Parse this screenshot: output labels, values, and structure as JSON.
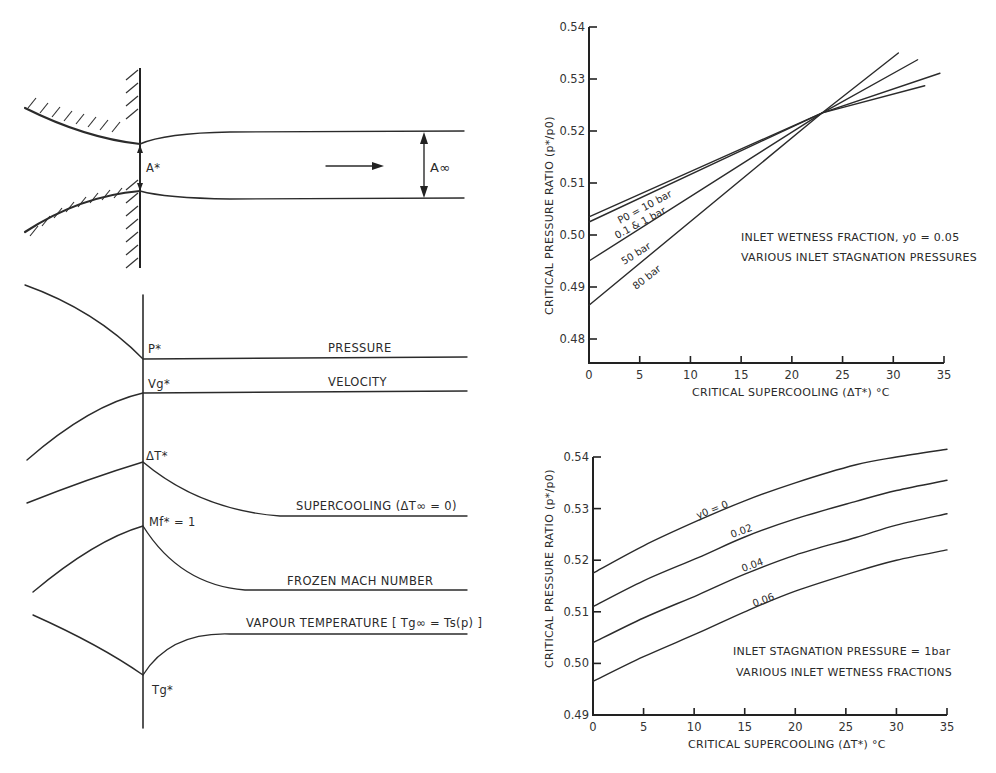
{
  "schematic": {
    "throat_area_label": "A*",
    "exit_area_label": "A∞",
    "profiles": [
      {
        "id": "pressure",
        "label": "PRESSURE",
        "point_label": "P*"
      },
      {
        "id": "velocity",
        "label": "VELOCITY",
        "point_label": "Vg*"
      },
      {
        "id": "supercooling",
        "label": "SUPERCOOLING (ΔT∞ = 0)",
        "point_label": "ΔT*"
      },
      {
        "id": "mach",
        "label": "FROZEN MACH NUMBER",
        "point_label": "Mf* = 1"
      },
      {
        "id": "vapour_temp",
        "label": "VAPOUR TEMPERATURE [ Tg∞ = Ts(p) ]",
        "point_label": "Tg*"
      }
    ]
  },
  "chart_data": [
    {
      "type": "line",
      "title": "",
      "annotation": [
        "INLET WETNESS FRACTION, y0 = 0.05",
        "VARIOUS INLET STAGNATION PRESSURES"
      ],
      "xlabel": "CRITICAL SUPERCOOLING (ΔT*) °C",
      "ylabel": "CRITICAL PRESSURE RATIO (p*/p0)",
      "xlim": [
        0,
        35
      ],
      "ylim": [
        0.475,
        0.54
      ],
      "xticks": [
        0,
        5,
        10,
        15,
        20,
        25,
        30,
        35
      ],
      "yticks": [
        0.48,
        0.49,
        0.5,
        0.51,
        0.52,
        0.53,
        0.54
      ],
      "ytick_labels": [
        "0.48",
        "0.49",
        "0.50",
        "0.51",
        "0.52",
        "0.53",
        "0.54"
      ],
      "grid": false,
      "series": [
        {
          "name": "p0 = 10 bar",
          "x": [
            0,
            23,
            34.6
          ],
          "y": [
            0.5035,
            0.5235,
            0.5311
          ]
        },
        {
          "name": "0.1 & 1 bar",
          "x": [
            0,
            23,
            33.1
          ],
          "y": [
            0.5025,
            0.5235,
            0.5287
          ]
        },
        {
          "name": "50 bar",
          "x": [
            0,
            23,
            32.4
          ],
          "y": [
            0.495,
            0.5235,
            0.5337
          ]
        },
        {
          "name": "80 bar",
          "x": [
            0,
            23,
            30.5
          ],
          "y": [
            0.4865,
            0.5235,
            0.535
          ]
        }
      ],
      "series_labels": [
        "P0 = 10 bar",
        "0.1 & 1 bar",
        "50 bar",
        "80 bar"
      ]
    },
    {
      "type": "line",
      "title": "",
      "annotation": [
        "INLET STAGNATION PRESSURE = 1bar",
        "VARIOUS INLET WETNESS FRACTIONS"
      ],
      "xlabel": "CRITICAL SUPERCOOLING (ΔT*) °C",
      "ylabel": "CRITICAL PRESSURE RATIO (p*/p0)",
      "xlim": [
        0,
        35
      ],
      "ylim": [
        0.49,
        0.54
      ],
      "xticks": [
        0,
        5,
        10,
        15,
        20,
        25,
        30,
        35
      ],
      "yticks": [
        0.49,
        0.5,
        0.51,
        0.52,
        0.53,
        0.54
      ],
      "ytick_labels": [
        "0.49",
        "0.50",
        "0.51",
        "0.52",
        "0.53",
        "0.54"
      ],
      "grid": false,
      "series": [
        {
          "name": "y0 = 0",
          "x": [
            0,
            5,
            10.4,
            15,
            20,
            26,
            30,
            35
          ],
          "y": [
            0.5175,
            0.5228,
            0.5277,
            0.5315,
            0.535,
            0.5385,
            0.54,
            0.5415
          ]
        },
        {
          "name": "0.02",
          "x": [
            0,
            5,
            10.4,
            15,
            20,
            26,
            30,
            35
          ],
          "y": [
            0.511,
            0.516,
            0.5205,
            0.5245,
            0.528,
            0.5314,
            0.5335,
            0.5355
          ]
        },
        {
          "name": "0.04",
          "x": [
            0,
            5,
            10.4,
            15,
            20,
            26,
            30,
            35
          ],
          "y": [
            0.504,
            0.5088,
            0.5133,
            0.5173,
            0.521,
            0.5244,
            0.5268,
            0.529
          ]
        },
        {
          "name": "0.06",
          "x": [
            0,
            5,
            10.4,
            15,
            20,
            26,
            30,
            35
          ],
          "y": [
            0.4965,
            0.5013,
            0.5059,
            0.51,
            0.514,
            0.5178,
            0.52,
            0.522
          ]
        }
      ],
      "series_labels": [
        "y0 = 0",
        "0.02",
        "0.04",
        "0.06"
      ]
    }
  ]
}
